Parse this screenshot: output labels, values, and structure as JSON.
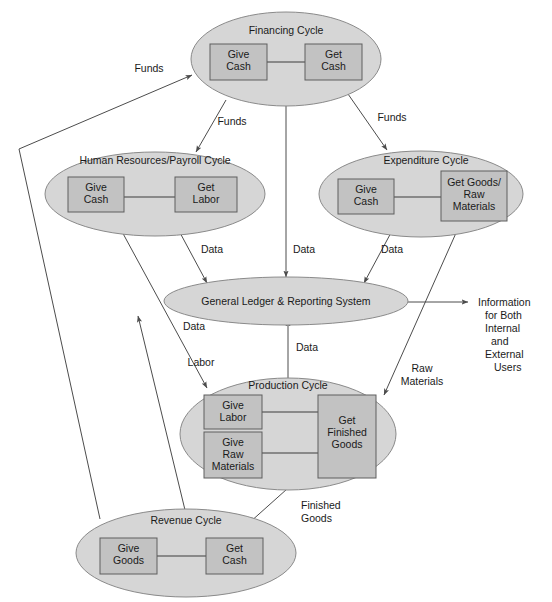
{
  "diagram": {
    "colors": {
      "ellipse_fill": "#d6d6d6",
      "ellipse_stroke": "#8a8a8a",
      "box_fill": "#c2c2c2",
      "box_stroke": "#5e5e5e",
      "line": "#4c4c4c",
      "background": "#ffffff",
      "text": "#1a1a1a"
    },
    "cycles": [
      {
        "id": "financing",
        "name": "Financing Cycle",
        "boxes": [
          {
            "id": "financing-give",
            "lines": [
              "Give",
              "Cash"
            ]
          },
          {
            "id": "financing-get",
            "lines": [
              "Get",
              "Cash"
            ]
          }
        ]
      },
      {
        "id": "hr-payroll",
        "name": "Human Resources/Payroll Cycle",
        "boxes": [
          {
            "id": "hr-give",
            "lines": [
              "Give",
              "Cash"
            ]
          },
          {
            "id": "hr-get",
            "lines": [
              "Get",
              "Labor"
            ]
          }
        ]
      },
      {
        "id": "expenditure",
        "name": "Expenditure Cycle",
        "boxes": [
          {
            "id": "exp-give",
            "lines": [
              "Give",
              "Cash"
            ]
          },
          {
            "id": "exp-get",
            "lines": [
              "Get Goods/",
              "Raw",
              "Materials"
            ]
          }
        ]
      },
      {
        "id": "general-ledger",
        "name": "General Ledger & Reporting System",
        "boxes": []
      },
      {
        "id": "production",
        "name": "Production Cycle",
        "boxes": [
          {
            "id": "prod-give-labor",
            "lines": [
              "Give",
              "Labor"
            ]
          },
          {
            "id": "prod-give-raw",
            "lines": [
              "Give",
              "Raw",
              "Materials"
            ]
          },
          {
            "id": "prod-get-finished",
            "lines": [
              "Get",
              "Finished",
              "Goods"
            ]
          }
        ]
      },
      {
        "id": "revenue",
        "name": "Revenue Cycle",
        "boxes": [
          {
            "id": "rev-give",
            "lines": [
              "Give",
              "Goods"
            ]
          },
          {
            "id": "rev-get",
            "lines": [
              "Get",
              "Cash"
            ]
          }
        ]
      }
    ],
    "flow_labels": [
      {
        "id": "funds-revenue-to-financing",
        "text": "Funds"
      },
      {
        "id": "funds-financing-to-hr",
        "text": "Funds"
      },
      {
        "id": "funds-financing-to-expenditure",
        "text": "Funds"
      },
      {
        "id": "data-hr-to-gl",
        "text": "Data"
      },
      {
        "id": "data-financing-to-gl",
        "text": "Data"
      },
      {
        "id": "data-expenditure-to-gl",
        "text": "Data"
      },
      {
        "id": "data-revenue-to-gl",
        "text": "Data"
      },
      {
        "id": "data-production-to-gl",
        "text": "Data"
      },
      {
        "id": "labor-hr-to-production",
        "text": "Labor"
      },
      {
        "id": "raw-materials-expenditure-to-production",
        "text": "Raw\nMaterials"
      },
      {
        "id": "finished-goods-production-to-revenue",
        "text": "Finished\nGoods"
      }
    ],
    "raw_materials_label": {
      "line1": "Raw",
      "line2": "Materials"
    },
    "finished_goods_label": {
      "line1": "Finished",
      "line2": "Goods"
    },
    "output_label": {
      "lines": [
        "Information",
        "for Both",
        "Internal",
        "and",
        "External",
        "Users"
      ]
    }
  }
}
